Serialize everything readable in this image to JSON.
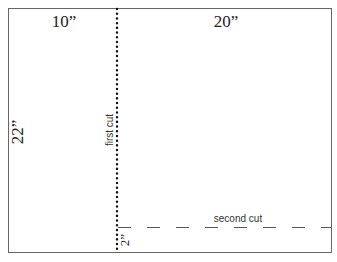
{
  "diagram": {
    "labels": {
      "left_width": "10”",
      "right_width": "20”",
      "height": "22”",
      "first_cut": "first cut",
      "second_cut": "second cut",
      "bottom_strip": "2”"
    },
    "colors": {
      "border": "#555555",
      "line": "#111111",
      "text": "#222222"
    }
  }
}
